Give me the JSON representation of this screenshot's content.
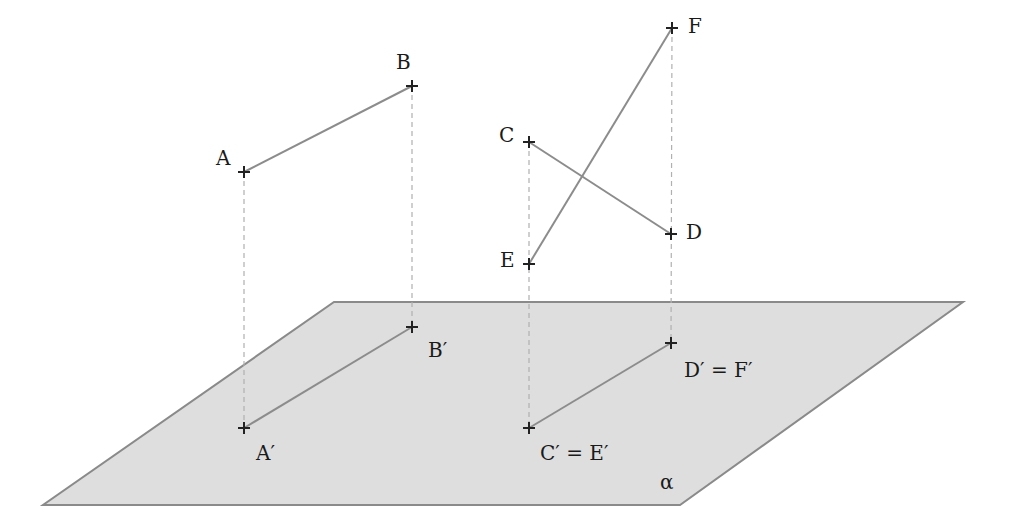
{
  "diagram": {
    "type": "orthogonal-projection",
    "plane": {
      "label": "α",
      "fill": "#dedede",
      "stroke": "#8a8a8a",
      "corners": [
        [
          43,
          505
        ],
        [
          680,
          505
        ],
        [
          963,
          302
        ],
        [
          334,
          302
        ]
      ]
    },
    "points": {
      "A": {
        "label": "A",
        "x": 244,
        "y": 172
      },
      "B": {
        "label": "B",
        "x": 412,
        "y": 86
      },
      "C": {
        "label": "C",
        "x": 529,
        "y": 142
      },
      "D": {
        "label": "D",
        "x": 671,
        "y": 234
      },
      "E": {
        "label": "E",
        "x": 529,
        "y": 264
      },
      "F": {
        "label": "F",
        "x": 672,
        "y": 28
      },
      "A_proj": {
        "label": "A′",
        "x": 244,
        "y": 428
      },
      "B_proj": {
        "label": "B′",
        "x": 412,
        "y": 327
      },
      "CE_proj": {
        "label": "C′ = E′",
        "x": 529,
        "y": 428
      },
      "DF_proj": {
        "label": "D′ = F′",
        "x": 671,
        "y": 343
      }
    },
    "segments": [
      {
        "from": "A",
        "to": "B"
      },
      {
        "from": "C",
        "to": "D"
      },
      {
        "from": "E",
        "to": "F"
      },
      {
        "from": "A_proj",
        "to": "B_proj"
      },
      {
        "from": "CE_proj",
        "to": "DF_proj"
      }
    ],
    "projection_lines": [
      {
        "from": "A",
        "to": "A_proj"
      },
      {
        "from": "B",
        "to": "B_proj"
      },
      {
        "from": "C",
        "to": "CE_proj"
      },
      {
        "from": "F",
        "to": "DF_proj"
      }
    ],
    "colors": {
      "segment": "#8c8c8c",
      "dashed": "#b5b5b5",
      "marker": "#222222"
    }
  }
}
